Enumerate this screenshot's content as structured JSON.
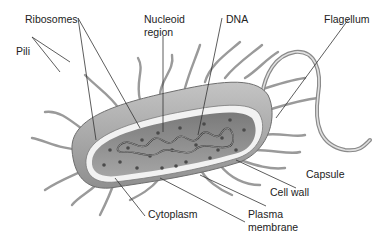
{
  "diagram": {
    "labels": {
      "ribosomes": "Ribosomes",
      "nucleoid_line1": "Nucleoid",
      "nucleoid_line2": "region",
      "dna": "DNA",
      "flagellum": "Flagellum",
      "pili": "Pili",
      "capsule": "Capsule",
      "cell_wall": "Cell wall",
      "cytoplasm": "Cytoplasm",
      "plasma_line1": "Plasma",
      "plasma_line2": "membrane"
    },
    "colors": {
      "background": "#ffffff",
      "capsule": "#a9a9a9",
      "cell_wall": "#f2f2f2",
      "cytoplasm": "#8e8e8e",
      "pili": "#9a9a9a",
      "leader_lines": "#333333",
      "text": "#222222"
    }
  }
}
